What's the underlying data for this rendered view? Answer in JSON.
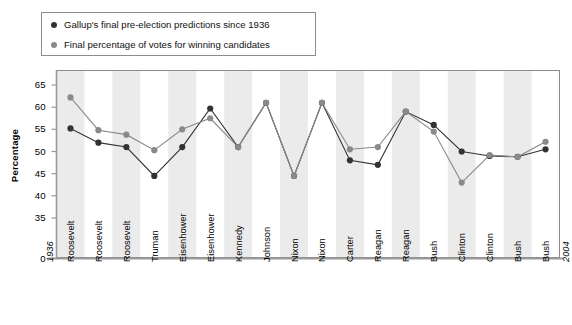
{
  "legend": {
    "items": [
      {
        "label": "Gallup's final pre-election predictions since 1936",
        "color": "#333333",
        "marker": "dot-dark"
      },
      {
        "label": "Final percentage of votes for winning candidates",
        "color": "#8a8a8a",
        "marker": "dot-gray"
      }
    ]
  },
  "axis": {
    "y_title": "Percentage",
    "y_ticks": [
      "65",
      "60",
      "55",
      "50",
      "45",
      "40",
      "35",
      "0"
    ],
    "x_start_label": "1936",
    "x_end_label": "2004"
  },
  "colors": {
    "series_dark": "#333333",
    "series_gray": "#8a8a8a",
    "band": "#ebebeb",
    "plot_border": "#8c8c8c",
    "axis_line": "#9a9a9a"
  },
  "chart_data": {
    "type": "line",
    "title": "",
    "xlabel": "",
    "ylabel": "Percentage",
    "ylim": [
      33,
      67
    ],
    "grid": false,
    "legend_position": "top-left",
    "categories": [
      "Roosevelt",
      "Roosevelt",
      "Roosevelt",
      "Truman",
      "Eisenhower",
      "Eisenhower",
      "Kennedy",
      "Johnson",
      "Nixon",
      "Nixon",
      "Carter",
      "Reagan",
      "Reagan",
      "Bush",
      "Clinton",
      "Clinton",
      "Bush",
      "Bush"
    ],
    "axis_endpoint_labels": {
      "start": "1936",
      "end": "2004"
    },
    "series": [
      {
        "name": "Gallup's final pre-election predictions since 1936",
        "color": "#333333",
        "values": [
          55.2,
          52.0,
          51.0,
          44.5,
          51.0,
          59.7,
          51.0,
          61.0,
          44.5,
          61.0,
          48.0,
          47.0,
          59.0,
          56.0,
          50.0,
          49.0,
          48.8,
          50.5
        ]
      },
      {
        "name": "Final percentage of votes for winning candidates",
        "color": "#8a8a8a",
        "values": [
          62.2,
          54.8,
          53.8,
          50.3,
          55.0,
          57.5,
          51.0,
          61.0,
          44.5,
          61.0,
          50.5,
          51.0,
          59.0,
          54.5,
          43.0,
          49.2,
          48.8,
          52.2
        ]
      }
    ]
  }
}
